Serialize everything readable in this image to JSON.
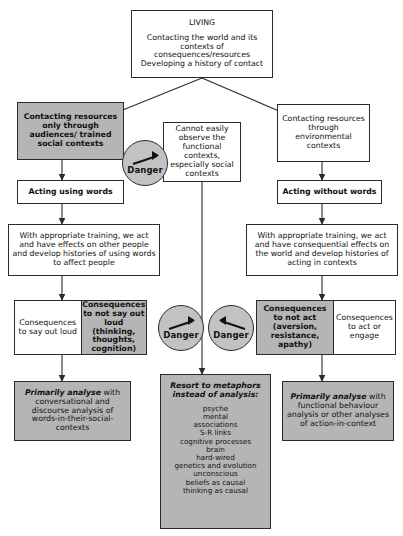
{
  "diagram": {
    "top": {
      "title": "LIVING",
      "line1": "Contacting the world and its",
      "line2": "contexts of consequences/resources",
      "line3": "Developing a history of contact"
    },
    "left_branch": {
      "contacting": "Contacting resources only through audiences/ trained social contexts",
      "acting": "Acting using words",
      "training": "With appropriate training, we act and have effects on other people and develop histories of using words to affect people",
      "consequence_plain": "Consequences to say out loud",
      "consequence_shaded": "Consequences to not say out loud (thinking, thoughts, cognition)",
      "analysis_emph": "Primarily analyse",
      "analysis_rest": " with conversational and discourse analysis of words-in-their-social-contexts"
    },
    "middle_branch": {
      "cannot_observe": "Cannot easily observe the functional contexts, especially social contexts",
      "metaphors_title_line1": "Resort to metaphors",
      "metaphors_title_line2": "instead of analysis:",
      "metaphors": [
        "psyche",
        "mental",
        "associations",
        "S-R links",
        "cognitive processes",
        "brain",
        "hard-wired",
        "genetics and evolution",
        "unconscious",
        "beliefs as causal",
        "thinking as causal"
      ]
    },
    "right_branch": {
      "contacting": "Contacting resources through environmental contexts",
      "acting": "Acting without words",
      "training": "With appropriate training, we act and have consequential effects on the world and develop histories of acting in contexts",
      "consequence_shaded": "Consequences to not act (aversion, resistance, apathy)",
      "consequence_plain": "Consequences to act or engage",
      "analysis_emph": "Primarily analyse",
      "analysis_rest": " with functional behaviour analysis or other analyses of action-in-context"
    },
    "danger_label": "Danger",
    "colors": {
      "shaded_fill": "#b5b5b5",
      "danger_fill": "#c2c2c2",
      "stroke": "#2b2b2b",
      "background": "#ffffff"
    }
  }
}
